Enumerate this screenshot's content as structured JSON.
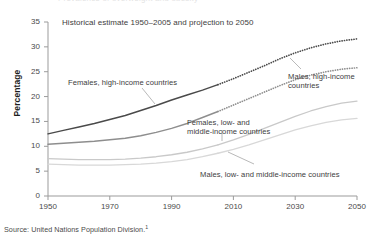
{
  "figure": {
    "top_cutoff_text": "Prevalence of overweight and obesity",
    "caption": "Historical estimate 1950–2005 and projection to 2050",
    "source_label": "Source: United Nations Population Division.",
    "source_footnote_marker": "1",
    "axis_title_y": "Percentage"
  },
  "colors": {
    "females_high": "#4a4a4a",
    "males_high": "#8e8e8e",
    "females_low": "#c9c9c9",
    "males_low": "#d8d8d8",
    "axis": "#9b9b9b",
    "text": "#3d3d3d"
  },
  "annotations": [
    {
      "name": "females-high-income-label",
      "lines": [
        "Females, high-income countries"
      ],
      "x": 68,
      "y": 78
    },
    {
      "name": "males-high-income-label",
      "lines": [
        "Males, high-income",
        "countries"
      ],
      "x": 288,
      "y": 72
    },
    {
      "name": "females-low-middle-income-label",
      "lines": [
        "Females, low- and",
        "middle-income countries"
      ],
      "x": 187,
      "y": 118
    },
    {
      "name": "males-low-middle-income-label",
      "lines": [
        "Males, low- and middle-income countries"
      ],
      "x": 200,
      "y": 170
    }
  ],
  "chart_data": {
    "type": "line",
    "title": "Historical estimate 1950–2005 and projection to 2050",
    "xlabel": "",
    "ylabel": "Percentage",
    "xlim": [
      1950,
      2050
    ],
    "ylim": [
      0,
      35
    ],
    "xticks": [
      1950,
      1970,
      1990,
      2010,
      2030,
      2050
    ],
    "yticks": [
      0,
      5,
      10,
      15,
      20,
      25,
      30,
      35
    ],
    "grid": false,
    "legend": "inline-annotations",
    "historical_range": [
      1950,
      2005
    ],
    "projection_range": [
      2005,
      2050
    ],
    "x": [
      1950,
      1955,
      1960,
      1965,
      1970,
      1975,
      1980,
      1985,
      1990,
      1995,
      2000,
      2005,
      2010,
      2015,
      2020,
      2025,
      2030,
      2035,
      2040,
      2045,
      2050
    ],
    "series": [
      {
        "name": "Females, high-income countries",
        "color": "#4a4a4a",
        "style_historical": "solid",
        "style_projection": "dotted",
        "values": [
          12.5,
          13.2,
          13.9,
          14.6,
          15.4,
          16.2,
          17.2,
          18.2,
          19.3,
          20.3,
          21.3,
          22.4,
          23.6,
          24.9,
          26.2,
          27.6,
          28.8,
          29.8,
          30.6,
          31.2,
          31.6
        ]
      },
      {
        "name": "Males, high-income countries",
        "color": "#8e8e8e",
        "style_historical": "solid",
        "style_projection": "dotted",
        "values": [
          10.4,
          10.6,
          10.8,
          11.0,
          11.3,
          11.6,
          12.1,
          12.8,
          13.6,
          14.6,
          15.8,
          17.0,
          18.3,
          19.6,
          20.9,
          22.2,
          23.4,
          24.3,
          25.0,
          25.5,
          25.8
        ]
      },
      {
        "name": "Females, low- and middle-income countries",
        "color": "#c9c9c9",
        "style_historical": "solid",
        "style_projection": "solid",
        "values": [
          7.5,
          7.4,
          7.3,
          7.3,
          7.3,
          7.4,
          7.6,
          7.9,
          8.3,
          8.8,
          9.5,
          10.3,
          11.3,
          12.4,
          13.6,
          14.8,
          16.0,
          17.1,
          18.0,
          18.7,
          19.1
        ]
      },
      {
        "name": "Males, low- and middle-income countries",
        "color": "#d8d8d8",
        "style_historical": "solid",
        "style_projection": "solid",
        "values": [
          6.4,
          6.3,
          6.2,
          6.2,
          6.2,
          6.3,
          6.4,
          6.6,
          6.9,
          7.3,
          7.9,
          8.6,
          9.4,
          10.3,
          11.3,
          12.3,
          13.3,
          14.1,
          14.8,
          15.3,
          15.6
        ]
      }
    ]
  }
}
